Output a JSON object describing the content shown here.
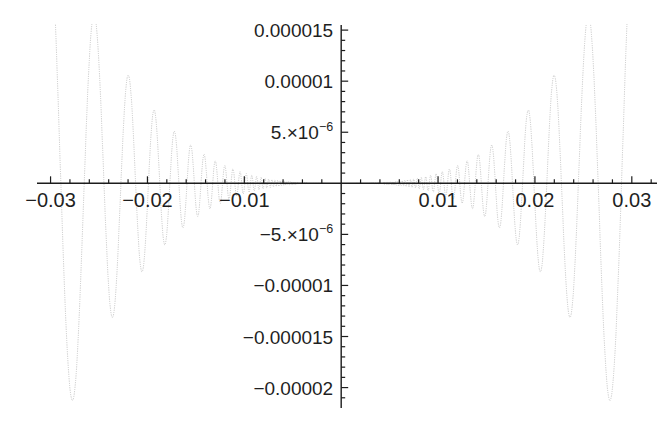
{
  "page": {
    "background": "#ffffff"
  },
  "chart_data": {
    "type": "line",
    "title": "",
    "xlabel": "",
    "ylabel": "",
    "legend": false,
    "grid": false,
    "function": "f(x) = x^3 * sin(1/x)",
    "function_id": "x3_sin_inv_x",
    "symmetry": "even",
    "x_domain": [
      -0.0312,
      0.0312
    ],
    "x_range": [
      -0.0314,
      0.0326
    ],
    "y_range": [
      -2.2e-05,
      1.55e-05
    ],
    "x_ticks": [
      {
        "value": -0.03,
        "label": "−0.03"
      },
      {
        "value": -0.02,
        "label": "−0.02"
      },
      {
        "value": -0.01,
        "label": "−0.01"
      },
      {
        "value": 0.01,
        "label": "0.01"
      },
      {
        "value": 0.02,
        "label": "0.02"
      },
      {
        "value": 0.03,
        "label": "0.03"
      }
    ],
    "x_minor_tick_step": 0.002,
    "y_ticks": [
      {
        "value": 1.5e-05,
        "label": "0.000015"
      },
      {
        "value": 1e-05,
        "label": "0.00001"
      },
      {
        "value": 5e-06,
        "label": "5.×10",
        "sup": "−6"
      },
      {
        "value": -5e-06,
        "label": "−5.×10",
        "sup": "−6"
      },
      {
        "value": -1e-05,
        "label": "−0.00001"
      },
      {
        "value": -1.5e-05,
        "label": "−0.000015"
      },
      {
        "value": -2e-05,
        "label": "−0.00002"
      }
    ],
    "y_minor_tick_step": 1e-06,
    "notable_extrema": [
      {
        "x": 0.030315,
        "y": 2.786e-05,
        "clipped_at_top": true
      },
      {
        "x": 0.027679,
        "y": -2.1206e-05
      },
      {
        "x": 0.025465,
        "y": 1.6513e-05,
        "clipped_at_top": true
      },
      {
        "x": 0.023579,
        "y": -1.3109e-05
      },
      {
        "x": 0.021952,
        "y": 1.058e-05
      },
      {
        "x": 0.020536,
        "y": -8.661e-06
      },
      {
        "x": 0.019292,
        "y": 7.18e-06
      },
      {
        "x": 0.018189,
        "y": -6.019e-06
      },
      {
        "x": 0.017206,
        "y": 5.094e-06
      },
      {
        "x": 0.016324,
        "y": -4.35e-06
      }
    ],
    "extrema_note": "function is even: mirrored extrema at negative x",
    "style": {
      "axis_color": "#1c1c1c",
      "tick_color": "#1c1c1c",
      "label_color": "#1f1f1f",
      "curve_color": "#9b9b9b",
      "curve_style": "dotted"
    }
  }
}
